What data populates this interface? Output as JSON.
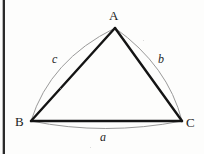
{
  "figure": {
    "type": "geometry-diagram",
    "background_color": "#fdfdfc",
    "chord_color": "#141414",
    "arc_color": "#9a9a9a",
    "label_color": "#1b1b1b",
    "page_edge_color": "#2a2a2a",
    "vertices": [
      {
        "name": "A",
        "label": "A",
        "x": 115,
        "y": 28
      },
      {
        "name": "B",
        "label": "B",
        "x": 31,
        "y": 121
      },
      {
        "name": "C",
        "label": "C",
        "x": 182,
        "y": 121
      }
    ],
    "sides": [
      {
        "name": "a",
        "label": "a",
        "from": "B",
        "to": "C",
        "arc_bulge": "outward-down"
      },
      {
        "name": "b",
        "label": "b",
        "from": "A",
        "to": "C",
        "arc_bulge": "outward-right"
      },
      {
        "name": "c",
        "label": "c",
        "from": "B",
        "to": "A",
        "arc_bulge": "outward-left"
      }
    ],
    "labels": {
      "vertex_A": "A",
      "vertex_B": "B",
      "vertex_C": "C",
      "side_a": "a",
      "side_b": "b",
      "side_c": "c"
    }
  }
}
